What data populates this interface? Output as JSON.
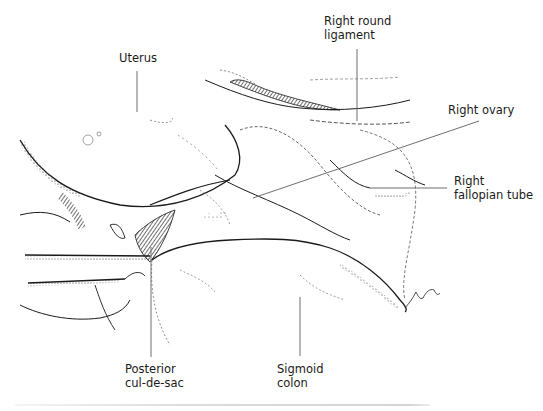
{
  "figure": {
    "type": "anatomical-illustration",
    "labels": [
      {
        "id": "uterus",
        "lines": [
          "Uterus"
        ]
      },
      {
        "id": "right-round-ligament",
        "lines": [
          "Right round",
          "ligament"
        ]
      },
      {
        "id": "right-ovary",
        "lines": [
          "Right ovary"
        ]
      },
      {
        "id": "right-fallopian-tube",
        "lines": [
          "Right",
          "fallopian tube"
        ]
      },
      {
        "id": "posterior-cul-de-sac",
        "lines": [
          "Posterior",
          "cul-de-sac"
        ]
      },
      {
        "id": "sigmoid-colon",
        "lines": [
          "Sigmoid",
          "colon"
        ]
      }
    ],
    "signature": "M. Shanley"
  },
  "colors": {
    "ink": "#1a1a1a",
    "leader": "#6e6e6e",
    "background": "#ffffff"
  }
}
